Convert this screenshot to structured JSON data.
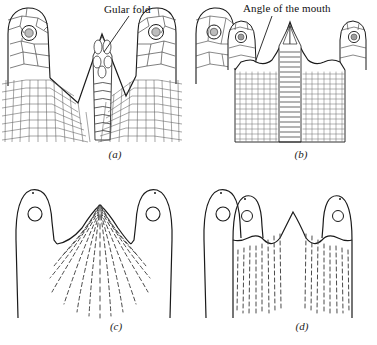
{
  "figure": {
    "kind": "scientific-illustration",
    "background_color": "#ffffff",
    "ink_color": "#1a1a1a",
    "dash_color": "#3a3a3a"
  },
  "labels": {
    "gular_fold": "Gular fold",
    "angle_of_the_mouth": "Angle of the mouth"
  },
  "panels": [
    {
      "id": "a",
      "caption": "(a)",
      "description": "Detailed scalation of throat with central ladder of elongate gular scales and two lateral head lobes bearing tympanum",
      "label": "Gular fold",
      "style": "detailed-scales",
      "lateral_lobes": 2,
      "center_ladder_segments": 9
    },
    {
      "id": "b",
      "caption": "(b)",
      "description": "Detailed scalation with granular throat scales and a narrow central band of transverse plates",
      "label": "Angle of the mouth",
      "style": "granular-scales",
      "lateral_lobes": 2,
      "center_ladder_segments": 20
    },
    {
      "id": "c",
      "caption": "(c)",
      "description": "Schematic outline of the same region with dashed fold lines radiating from a central apex",
      "label": "",
      "style": "schematic-dashed",
      "lateral_lobes": 2,
      "dash_pattern": "radiating"
    },
    {
      "id": "d",
      "caption": "(d)",
      "description": "Schematic outline with three humps and two groups of vertical dashed fold lines",
      "label": "",
      "style": "schematic-dashed",
      "lateral_lobes": 2,
      "dash_pattern": "vertical"
    }
  ]
}
